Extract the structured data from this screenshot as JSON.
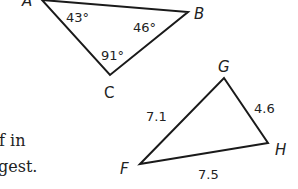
{
  "triangle_abc": {
    "vertices": {
      "A": "A",
      "B": "B",
      "C": "C"
    },
    "angles": {
      "A": "43°",
      "B": "46°",
      "C": "91°"
    }
  },
  "triangle_fgh": {
    "vertices": {
      "F": "F",
      "G": "G",
      "H": "H"
    },
    "sides": {
      "FG": "7.1",
      "GH": "4.6",
      "FH": "7.5"
    }
  },
  "clipped_text": {
    "line1": "f in",
    "line2": "gest."
  },
  "colors": {
    "stroke": "#1a1a1a",
    "text": "#222222",
    "background": "#ffffff"
  }
}
